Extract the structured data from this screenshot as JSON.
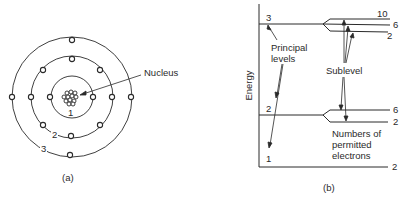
{
  "panel_a": {
    "caption": "(a)",
    "nucleus_label": "Nucleus",
    "shell_labels": [
      "1",
      "2",
      "3"
    ],
    "shells": [
      {
        "n": 1,
        "electrons": 2
      },
      {
        "n": 2,
        "electrons": 8
      },
      {
        "n": 3,
        "electrons": 4
      }
    ]
  },
  "panel_b": {
    "caption": "(b)",
    "axis_label": "Energy",
    "principal_levels_label": [
      "Principal",
      "levels"
    ],
    "sublevel_label": "Sublevel",
    "permitted_label": [
      "Numbers of",
      "permitted",
      "electrons"
    ],
    "level_numbers": [
      "3",
      "2",
      "1"
    ],
    "level3_sublevels": [
      "10",
      "6",
      "2"
    ],
    "level2_sublevels": [
      "6",
      "2"
    ],
    "level1_sublevels": [
      "2"
    ]
  }
}
